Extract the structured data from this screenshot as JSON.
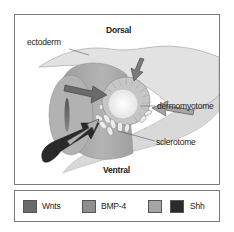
{
  "diagram": {
    "labels": {
      "dorsal": "Dorsal",
      "ventral": "Ventral",
      "ectoderm": "ectoderm",
      "dermomyotome": "dermomyotome",
      "sclerotome": "sclerotome"
    },
    "colors": {
      "wnts": "#6a6a6a",
      "bmp4": "#8e8e8e",
      "unlabeled_light": "#a6a6a6",
      "shh": "#2a2a2a",
      "ectoderm": "#dedede",
      "neural_tube": "#a9a9a9",
      "somite_ring": "#c4c4c4",
      "somite_core": "#f2f2f2"
    }
  },
  "legend": {
    "items": [
      {
        "label": "Wnts",
        "color": "#6a6a6a"
      },
      {
        "label": "BMP-4",
        "color": "#8e8e8e"
      },
      {
        "label": "",
        "color": "#a6a6a6"
      },
      {
        "label": "Shh",
        "color": "#2a2a2a"
      }
    ]
  }
}
